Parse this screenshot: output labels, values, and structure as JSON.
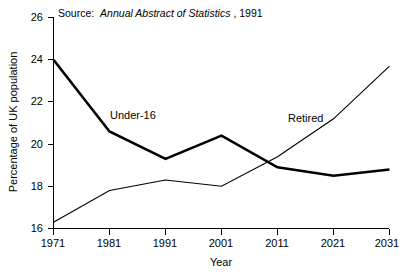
{
  "chart_data": {
    "type": "line",
    "title": "",
    "xlabel": "Year",
    "ylabel": "Percentage of UK population",
    "x": [
      1971,
      1981,
      1991,
      2001,
      2011,
      2021,
      2031
    ],
    "xticklabels": [
      "1971",
      "1981",
      "1991",
      "2001",
      "2011",
      "2021",
      "2031"
    ],
    "xlim": [
      1971,
      2031
    ],
    "ylim": [
      16,
      26
    ],
    "yticks": [
      16,
      18,
      20,
      22,
      24,
      26
    ],
    "yticklabels": [
      "16",
      "18",
      "20",
      "22",
      "24",
      "26"
    ],
    "grid": false,
    "legend": "inline-labels",
    "series": [
      {
        "name": "Under-16",
        "label": "Under-16",
        "style": "thick",
        "values": [
          24.0,
          20.6,
          19.3,
          20.4,
          18.9,
          18.5,
          18.8
        ]
      },
      {
        "name": "Retired",
        "label": "Retired",
        "style": "thin",
        "values": [
          16.3,
          17.8,
          18.3,
          18.0,
          19.4,
          21.2,
          23.7
        ]
      }
    ],
    "annotations": {
      "source_prefix": "Source:",
      "source_italic": "Annual Abstract of Statistics",
      "source_suffix": ", 1991"
    }
  },
  "colors": {
    "axis": "#000000",
    "series_under16": "#000000",
    "series_retired": "#000000",
    "background": "#ffffff"
  }
}
